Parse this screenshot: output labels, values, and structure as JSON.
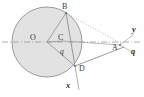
{
  "figure": {
    "kind": "circle-geometry-diagram",
    "width": 144,
    "height": 97,
    "background_color": "#ffffff"
  },
  "colors": {
    "stroke": "#8a8a8a",
    "circle_fill": "#e0e0e0",
    "circle_stroke": "#9a9a9a",
    "dashed_axis": "#9d9d9d",
    "dotted_line": "#b0b0b0",
    "label_text": "#3a3a3a",
    "axis_label_text": "#2e2e2e"
  },
  "circle": {
    "center_label": "O",
    "cx": 47,
    "cy": 42,
    "r": 35
  },
  "points": [
    {
      "id": "O",
      "label": "O",
      "x": 47,
      "y": 42,
      "label_x": 30,
      "label_y": 40,
      "on": "center"
    },
    {
      "id": "B",
      "label": "B",
      "x": 66,
      "y": 13,
      "label_x": 63,
      "label_y": 8,
      "on": "circle"
    },
    {
      "id": "C",
      "label": "C",
      "x": 64,
      "y": 41,
      "label_x": 60,
      "label_y": 39,
      "on": "interior"
    },
    {
      "id": "D",
      "label": "D",
      "x": 75,
      "y": 66,
      "label_x": 79,
      "label_y": 70,
      "on": "circle"
    },
    {
      "id": "A",
      "label": "A",
      "x": 120,
      "y": 45,
      "label_x": 115,
      "label_y": 48,
      "on": "axis"
    }
  ],
  "angle": {
    "label": "q",
    "vertex": "C",
    "label_x": 62,
    "label_y": 52
  },
  "axis_labels": [
    {
      "id": "y",
      "label": "y",
      "x": 133,
      "y": 30
    },
    {
      "id": "q",
      "label": "q",
      "x": 133,
      "y": 50
    },
    {
      "id": "x",
      "label": "x",
      "x": 70,
      "y": 86
    }
  ],
  "segments": [
    {
      "id": "O-B",
      "from": "O",
      "to": "B",
      "style": "solid"
    },
    {
      "id": "O-C",
      "from": "O",
      "to": "C",
      "style": "solid"
    },
    {
      "id": "O-D",
      "from": "O",
      "to": "D",
      "style": "solid"
    },
    {
      "id": "B-D",
      "from": "B",
      "to": "D",
      "style": "solid"
    },
    {
      "id": "C-A",
      "from": "C",
      "to": "A",
      "style": "solid"
    },
    {
      "id": "D-A",
      "from": "D",
      "to": "A",
      "style": "solid"
    },
    {
      "id": "B-A",
      "from": "B",
      "to": "A",
      "style": "dotted"
    }
  ],
  "dashed_axis": {
    "id": "horizontal-axis",
    "x1": 2,
    "y1": 42,
    "x2": 142,
    "y2": 42,
    "style": "dash-dot"
  }
}
